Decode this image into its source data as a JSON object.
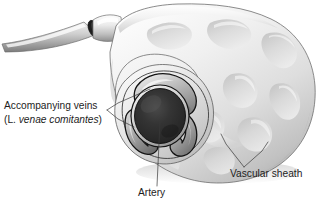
{
  "figure": {
    "background_color": "#ffffff",
    "style": "grayscale medical illustration",
    "labels": [
      {
        "id": "accompanying-veins",
        "line1": "Accompanying veins",
        "line2_prefix": "(L. ",
        "line2_italic": "venae comitantes",
        "line2_suffix": ")",
        "x": 4,
        "y": 109,
        "text_color": "#1d1d1d"
      },
      {
        "id": "artery",
        "text": "Artery",
        "x": 138,
        "y": 196,
        "text_color": "#1d1d1d"
      },
      {
        "id": "vascular-sheath",
        "text": "Vascular sheath",
        "x": 230,
        "y": 177,
        "text_color": "#1d1d1d"
      }
    ],
    "anatomy": {
      "sheath_fill_light": "#f6f6f6",
      "sheath_fill_mid": "#d8d8d8",
      "sheath_fill_dark": "#a8a8a8",
      "sheath_outline": "#6e6e6e",
      "artery_lumen": "#2b2b2b",
      "vein_wall": "#1a1a1a",
      "vein_fill": "#9a9a9a",
      "fenestration_color": "#c9c9c9",
      "parts": [
        "vascular sheath",
        "artery",
        "accompanying veins",
        "cut tubular branch"
      ],
      "vein_count": 3
    },
    "leader_lines": {
      "stroke_color": "#3a3a3a",
      "stroke_width": 0.7
    }
  }
}
